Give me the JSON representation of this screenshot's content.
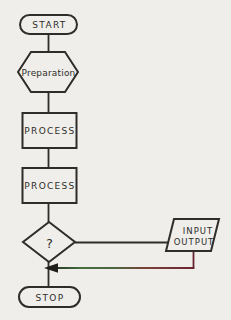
{
  "page": {
    "background_color": "#efeeea",
    "ink_color": "#2e2d29"
  },
  "flowchart": {
    "type": "flowchart",
    "nodes": {
      "start": {
        "label": "START",
        "shape": "terminator"
      },
      "preparation": {
        "label": "Preparation",
        "shape": "hexagon"
      },
      "process1": {
        "label": "PROCESS",
        "shape": "rectangle"
      },
      "process2": {
        "label": "PROCESS",
        "shape": "rectangle"
      },
      "decision": {
        "label": "?",
        "shape": "diamond"
      },
      "io": {
        "label_line1": "INPUT",
        "label_line2": "OUTPUT",
        "shape": "parallelogram"
      },
      "stop": {
        "label": "STOP",
        "shape": "terminator"
      }
    },
    "edges": [
      {
        "from": "start",
        "to": "preparation"
      },
      {
        "from": "preparation",
        "to": "process1"
      },
      {
        "from": "process1",
        "to": "process2"
      },
      {
        "from": "process2",
        "to": "decision"
      },
      {
        "from": "decision",
        "to": "io",
        "direction": "right"
      },
      {
        "from": "io",
        "to": "decision-stop-trunk",
        "direction": "down-left",
        "arrowhead": "left"
      },
      {
        "from": "decision",
        "to": "stop"
      }
    ],
    "colors": {
      "return_line_green": "#44703f",
      "return_line_red": "#6b2331",
      "arrowhead_black": "#1f1e1b"
    }
  }
}
